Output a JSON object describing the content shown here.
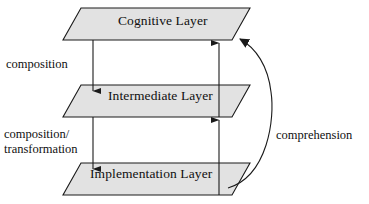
{
  "diagram": {
    "background_color": "#ffffff",
    "stroke_color": "#1a1a1a",
    "layer_fill_color": "#e2e2e2",
    "layers": [
      {
        "id": "cognitive",
        "label": "Cognitive Layer"
      },
      {
        "id": "intermediate",
        "label": "Intermediate Layer"
      },
      {
        "id": "implementation",
        "label": "Implementation Layer"
      }
    ],
    "edge_labels": {
      "composition": "composition",
      "composition_transformation_line1": "composition/",
      "composition_transformation_line2": "transformation",
      "comprehension": "comprehension"
    }
  }
}
